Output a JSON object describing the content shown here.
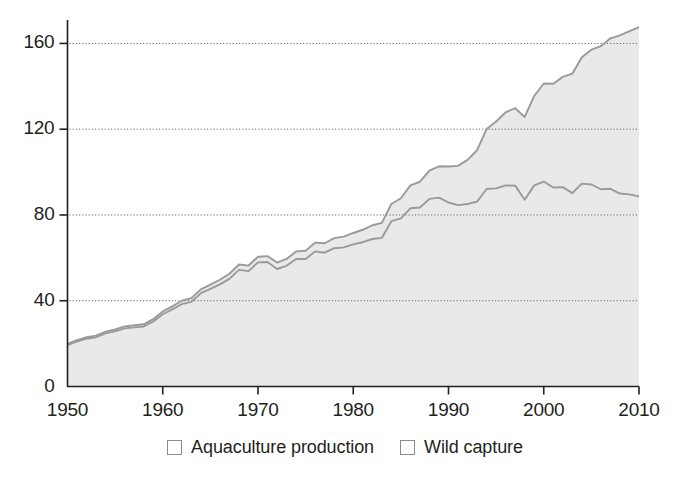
{
  "chart_data": {
    "type": "area",
    "title": "",
    "subtitle": "",
    "xlabel": "",
    "ylabel": "",
    "xlim": [
      1950,
      2010
    ],
    "ylim": [
      0,
      170
    ],
    "xticks": [
      1950,
      1960,
      1970,
      1980,
      1990,
      2000,
      2010
    ],
    "xtick_labels": [
      "1950",
      "1960",
      "1970",
      "1980",
      "1990",
      "2000",
      "2010"
    ],
    "yticks": [
      0,
      40,
      80,
      120,
      160
    ],
    "ytick_labels": [
      "0",
      "40",
      "80",
      "120",
      "160"
    ],
    "grid": "horizontal-dotted",
    "legend_position": "bottom-center",
    "stacked": true,
    "x": [
      1950,
      1951,
      1952,
      1953,
      1954,
      1955,
      1956,
      1957,
      1958,
      1959,
      1960,
      1961,
      1962,
      1963,
      1964,
      1965,
      1966,
      1967,
      1968,
      1969,
      1970,
      1971,
      1972,
      1973,
      1974,
      1975,
      1976,
      1977,
      1978,
      1979,
      1980,
      1981,
      1982,
      1983,
      1984,
      1985,
      1986,
      1987,
      1988,
      1989,
      1990,
      1991,
      1992,
      1993,
      1994,
      1995,
      1996,
      1997,
      1998,
      1999,
      2000,
      2001,
      2002,
      2003,
      2004,
      2005,
      2006,
      2007,
      2008,
      2009,
      2010
    ],
    "series": [
      {
        "name": "Wild capture",
        "color": "#e6e6e6",
        "line_color": "#8c8c8c",
        "values": [
          19.3,
          21.0,
          22.3,
          23.0,
          24.8,
          25.7,
          27.1,
          27.6,
          28.0,
          30.3,
          33.7,
          36.0,
          38.4,
          39.5,
          43.5,
          45.5,
          47.6,
          50.2,
          54.4,
          53.8,
          57.9,
          58.1,
          54.8,
          56.3,
          59.5,
          59.5,
          63.0,
          62.4,
          64.5,
          64.9,
          66.3,
          67.3,
          68.8,
          69.3,
          77.1,
          78.4,
          83.1,
          83.5,
          87.5,
          88.1,
          85.8,
          84.6,
          85.1,
          86.2,
          92.1,
          92.4,
          93.8,
          93.7,
          87.1,
          93.8,
          95.6,
          92.8,
          93.0,
          90.2,
          94.6,
          94.2,
          92.0,
          92.2,
          90.0,
          89.6,
          88.6
        ]
      },
      {
        "name": "Aquaculture production",
        "color": "#e6e6e6",
        "line_color": "#8c8c8c",
        "values": [
          0.6,
          0.6,
          0.7,
          0.7,
          0.8,
          0.9,
          0.9,
          1.0,
          1.0,
          1.1,
          1.3,
          1.4,
          1.6,
          1.7,
          1.8,
          2.0,
          2.2,
          2.4,
          2.5,
          2.6,
          2.6,
          2.7,
          3.0,
          3.2,
          3.5,
          3.8,
          4.1,
          4.4,
          4.7,
          5.0,
          5.3,
          5.8,
          6.4,
          7.0,
          8.0,
          9.4,
          10.7,
          12.0,
          13.2,
          14.6,
          16.8,
          18.3,
          20.6,
          24.0,
          28.0,
          31.2,
          34.1,
          36.1,
          38.6,
          41.7,
          45.7,
          48.4,
          51.4,
          55.7,
          59.0,
          62.9,
          66.7,
          70.2,
          73.8,
          76.2,
          79.0
        ]
      }
    ],
    "total_values": [
      19.9,
      21.6,
      23.0,
      23.7,
      25.6,
      26.6,
      28.0,
      28.6,
      29.0,
      31.4,
      35.0,
      37.4,
      40.0,
      41.2,
      45.3,
      47.5,
      49.8,
      52.6,
      56.9,
      56.4,
      60.5,
      60.8,
      57.8,
      59.5,
      63.0,
      63.3,
      67.1,
      66.8,
      69.2,
      69.9,
      71.6,
      73.1,
      75.2,
      76.3,
      85.1,
      87.8,
      93.8,
      95.5,
      100.7,
      102.7,
      102.6,
      102.9,
      105.7,
      110.2,
      120.1,
      123.6,
      127.9,
      129.8,
      125.7,
      135.5,
      141.3,
      141.2,
      144.4,
      145.9,
      153.6,
      157.1,
      158.7,
      162.4,
      163.8,
      165.8,
      167.6
    ]
  },
  "axes": {
    "y_ticks": [
      {
        "label": "160",
        "value": 160
      },
      {
        "label": "120",
        "value": 120
      },
      {
        "label": "80",
        "value": 80
      },
      {
        "label": "40",
        "value": 40
      },
      {
        "label": "0",
        "value": 0
      }
    ],
    "x_ticks": [
      {
        "label": "1950",
        "value": 1950
      },
      {
        "label": "1960",
        "value": 1960
      },
      {
        "label": "1970",
        "value": 1970
      },
      {
        "label": "1980",
        "value": 1980
      },
      {
        "label": "1990",
        "value": 1990
      },
      {
        "label": "2000",
        "value": 2000
      },
      {
        "label": "2010",
        "value": 2010
      }
    ]
  },
  "legend": {
    "items": [
      {
        "label": "Aquaculture production",
        "swatch_color": "#e6e6e6"
      },
      {
        "label": "Wild capture",
        "swatch_color": "#e6e6e6"
      }
    ]
  },
  "colors": {
    "axis": "#231f20",
    "grid": "#4d4d4d",
    "area_fill": "#e6e6e6",
    "line": "#8c8c8c",
    "background": "#ffffff"
  }
}
